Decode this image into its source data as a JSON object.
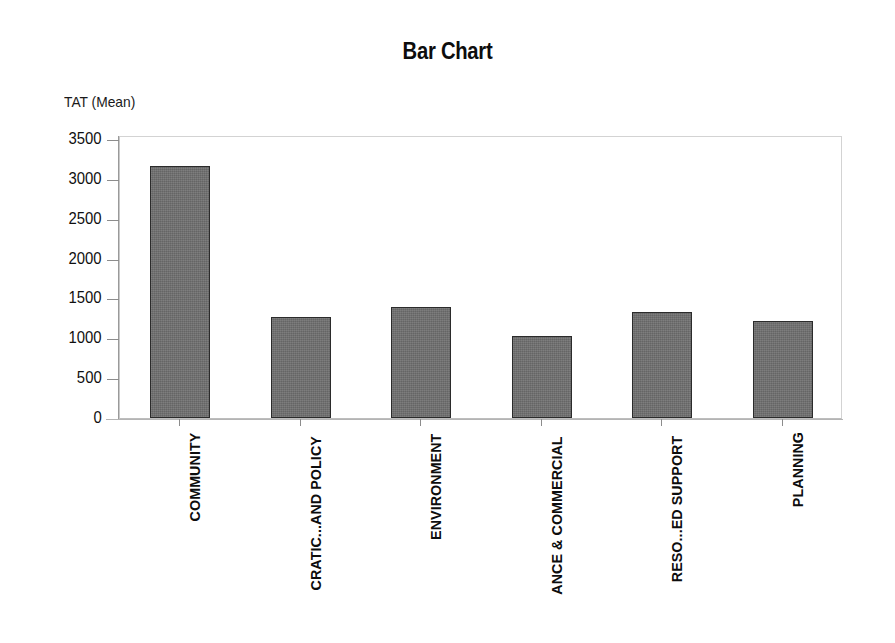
{
  "chart_data": {
    "type": "bar",
    "title": "Bar Chart",
    "xlabel": "",
    "ylabel": "TAT (Mean)",
    "categories": [
      "COMMUNITY",
      "CRATIC...AND POLICY",
      "ENVIRONMENT",
      "ANCE & COMMERCIAL",
      "RESO...ED SUPPORT",
      "PLANNING"
    ],
    "values": [
      3160,
      1265,
      1390,
      1035,
      1330,
      1215
    ],
    "ylim": [
      0,
      3500
    ],
    "ytick_labels": [
      "3500",
      "3000",
      "2500",
      "2000",
      "1500",
      "1000",
      "500",
      "0"
    ],
    "ytick_values": [
      3500,
      3000,
      2500,
      2000,
      1500,
      1000,
      500,
      0
    ],
    "grid": false,
    "legend": false,
    "legend_position": "none",
    "bar_color": "#6f6f6f",
    "bar_edge_color": "#2b2b2b",
    "plot_border_color": "#d3d3d3",
    "axis_color": "#8c8c8c",
    "background_color": "#ffffff",
    "text_color": "#0d0d0d"
  }
}
